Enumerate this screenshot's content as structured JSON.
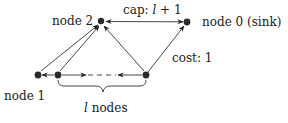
{
  "diagram": {
    "type": "flow-network",
    "nodes": [
      {
        "id": "node2",
        "label": "node 2",
        "x": 101,
        "y": 21
      },
      {
        "id": "node0",
        "label": "node 0 (sink)",
        "x": 187,
        "y": 22
      },
      {
        "id": "node1",
        "label": "node 1",
        "x": 38,
        "y": 75
      },
      {
        "id": "chainA",
        "label": "",
        "x": 58,
        "y": 75
      },
      {
        "id": "chainB",
        "label": "",
        "x": 146,
        "y": 75
      }
    ],
    "edges": [
      {
        "from": "node0",
        "to": "node2",
        "label": "cap: l + 1",
        "bidirectional": true
      },
      {
        "from": "chainB",
        "to": "node0",
        "label": "cost: 1"
      },
      {
        "from": "node1",
        "to": "node2"
      },
      {
        "from": "chainA",
        "to": "node2"
      },
      {
        "from": "chainB",
        "to": "node2"
      },
      {
        "from": "chainA",
        "to": "node1"
      },
      {
        "from": "chainA",
        "to": "chainB",
        "style": "dashed",
        "bidirectional": true
      }
    ],
    "labels": {
      "node2": "node 2",
      "node0": "node 0 (sink)",
      "node1": "node 1",
      "cap_prefix": "cap: ",
      "cap_var": "l",
      "cap_suffix": " + 1",
      "cost": "cost: 1",
      "brace_var": "l",
      "brace_suffix": " nodes"
    }
  }
}
